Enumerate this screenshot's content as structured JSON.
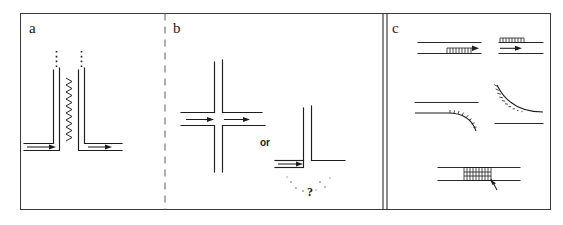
{
  "figure": {
    "width": 563,
    "height": 225,
    "background": "#ffffff",
    "ink_color": "#1d1d1d",
    "frame_color": "#3a3a3a"
  },
  "panels": [
    {
      "id": "a",
      "label": "a",
      "description": "Two L-shaped channels with flow arrows, coupled by a vertical zigzag spring; dotted line extensions above each vertical wall",
      "elements": {
        "left_channel_label": "L-shaped channel left",
        "right_channel_label": "L-shaped channel right",
        "coupling_label": "zigzag spring coupling",
        "flow_arrow_count": 2,
        "dotted_extension_count": 2
      }
    },
    {
      "id": "b",
      "label": "b",
      "connector_label": "or",
      "question_label": "?",
      "description": "A cross intersection of two double-line channels with two flow arrows, the word or, and a T-junction terminating a flow arrow with a question mark below",
      "elements": {
        "cross_label": "cross intersection",
        "tee_label": "T junction",
        "cross_arrow_count": 2,
        "tee_arrow_count": 1
      }
    },
    {
      "id": "c",
      "label": "c",
      "description": "Five channel wall segments showing hatched boundary layer regions, flow arrows and curved wall transitions",
      "elements": {
        "items": [
          "straight channel with hatched lower wall and arrow",
          "straight channel with hatched upper wall and arrow",
          "channel with lower wall curving downward and hatching",
          "channel with upper wall curving down to horizontal and hatching",
          "straight channel with hatched block bridging both walls and pointer arrow"
        ]
      }
    }
  ],
  "dividers": {
    "a_b_style": "dashed",
    "b_c_style": "solid-double"
  }
}
